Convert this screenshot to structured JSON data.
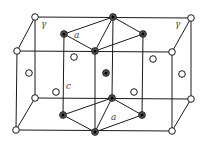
{
  "figure": {
    "labels": [
      {
        "id": "gamma-left",
        "text": "γ",
        "x": 41,
        "y": 27
      },
      {
        "id": "gamma-right",
        "text": "γ",
        "x": 175,
        "y": 27
      },
      {
        "id": "alpha-top",
        "text": "a",
        "x": 74,
        "y": 38
      },
      {
        "id": "c-axis",
        "text": "c",
        "x": 66,
        "y": 89
      },
      {
        "id": "alpha-bottom",
        "text": "a",
        "x": 111,
        "y": 120
      }
    ],
    "colors": {
      "line": "#1a1a1a",
      "open_atom_fill": "#ffffff",
      "filled_atom_ring": "#555555",
      "filled_atom_core": "#000000",
      "label": "#444444"
    }
  }
}
